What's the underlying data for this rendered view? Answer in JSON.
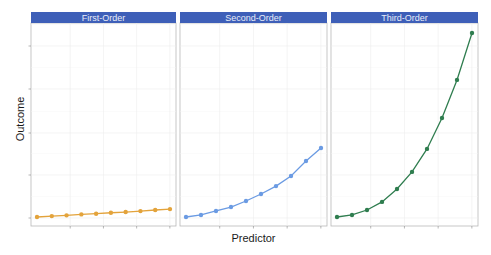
{
  "chart_data": [
    {
      "type": "line",
      "title": "First-Order",
      "x": [
        1,
        2,
        3,
        4,
        5,
        6,
        7,
        8,
        9,
        10
      ],
      "values": [
        0,
        5,
        9,
        14,
        18,
        23,
        27,
        32,
        38,
        43
      ],
      "color": "#e3a33b"
    },
    {
      "type": "line",
      "title": "Second-Order",
      "x": [
        1,
        2,
        3,
        4,
        5,
        6,
        7,
        8,
        9,
        10
      ],
      "values": [
        0,
        11,
        33,
        54,
        87,
        125,
        168,
        223,
        304,
        375
      ],
      "color": "#6b9be3"
    },
    {
      "type": "line",
      "title": "Third-Order",
      "x": [
        1,
        2,
        3,
        4,
        5,
        6,
        7,
        8,
        9,
        10
      ],
      "values": [
        0,
        11,
        38,
        82,
        152,
        245,
        370,
        538,
        745,
        1000
      ],
      "color": "#2f7d4f"
    }
  ],
  "layout": {
    "xlabel": "Predictor",
    "ylabel": "Outcome",
    "shared_y": true,
    "ylim": [
      -20,
      1000
    ],
    "grid": true,
    "strip_color": "#3e5fb8",
    "tick_labels_visible": false
  },
  "panels": [
    {
      "title": "First-Order"
    },
    {
      "title": "Second-Order"
    },
    {
      "title": "Third-Order"
    }
  ]
}
